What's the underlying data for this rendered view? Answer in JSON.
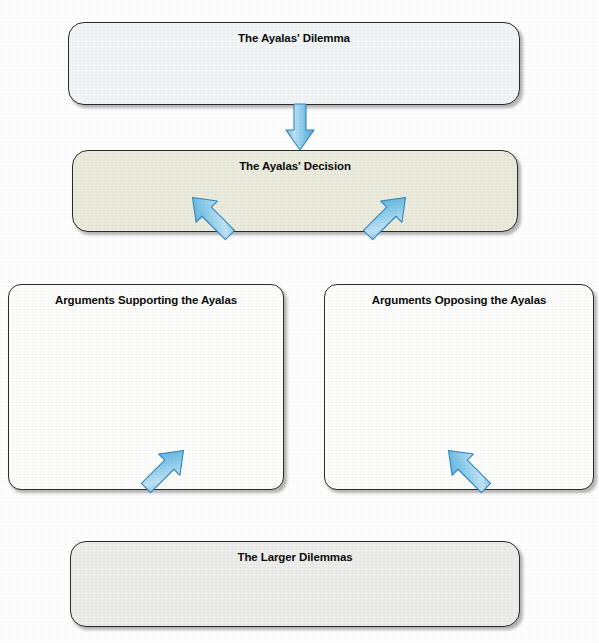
{
  "page": {
    "title": "THE 2R P OF 2R 2P WHEN ONE DOES NOT SHOULD HAVE HAD",
    "background_color": "#ffffff",
    "width": 599,
    "height": 643
  },
  "diagram": {
    "type": "flowchart",
    "name": "graphic-organizer",
    "arrow_color": "#6cb8e0",
    "arrow_outline_color": "#2f86bf",
    "boxes": [
      {
        "id": "dilemma",
        "label": "The Ayalas' Dilemma",
        "fill": "#f1f5f6",
        "border": "#2b2b2b",
        "body_text": ""
      },
      {
        "id": "decision",
        "label": "The Ayalas' Decision",
        "fill": "#eaebdd",
        "border": "#2b2b2b",
        "body_text": ""
      },
      {
        "id": "supporting",
        "label": "Arguments Supporting the Ayalas",
        "fill": "#fdfdfc",
        "border": "#2b2b2b",
        "body_text": ""
      },
      {
        "id": "opposing",
        "label": "Arguments Opposing the Ayalas",
        "fill": "#fdfdfc",
        "border": "#2b2b2b",
        "body_text": ""
      },
      {
        "id": "larger",
        "label": "The Larger Dilemmas",
        "fill": "#ededeb",
        "border": "#2b2b2b",
        "body_text": ""
      }
    ],
    "connectors": [
      {
        "id": "dilemma-to-decision",
        "from": "dilemma",
        "to": "decision",
        "direction": "down"
      },
      {
        "id": "decision-to-supporting",
        "from": "decision",
        "to": "supporting",
        "direction": "down-left"
      },
      {
        "id": "decision-to-opposing",
        "from": "decision",
        "to": "opposing",
        "direction": "down-right"
      },
      {
        "id": "supporting-to-larger",
        "from": "supporting",
        "to": "larger",
        "direction": "down-right"
      },
      {
        "id": "opposing-to-larger",
        "from": "opposing",
        "to": "larger",
        "direction": "down-left"
      }
    ]
  }
}
